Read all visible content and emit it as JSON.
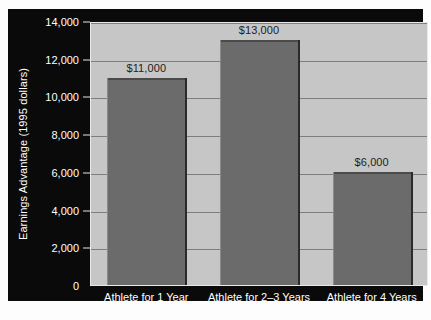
{
  "chart_data": {
    "type": "bar",
    "title": "",
    "xlabel": "",
    "ylabel": "Earnings Advantage (1995 dollars)",
    "categories": [
      "Athlete for 1 Year",
      "Athlete for 2–3 Years",
      "Athlete for 4 Years"
    ],
    "values": [
      11000,
      13000,
      6000
    ],
    "value_labels": [
      "$11,000",
      "$13,000",
      "$6,000"
    ],
    "ylim": [
      0,
      14000
    ],
    "yticks": [
      0,
      2000,
      4000,
      6000,
      8000,
      10000,
      12000,
      14000
    ],
    "ytick_labels": [
      "0",
      "2,000",
      "4,000",
      "6,000",
      "8,000",
      "10,000",
      "12,000",
      "14,000"
    ],
    "grid": true,
    "legend": false,
    "colors": {
      "bar": "#6b6b6b",
      "plot_background": "#c6c6c6",
      "panel_background": "#0a0a0a",
      "gridline": "#7e7e7e",
      "axis_text": "#ffffff",
      "value_text": "#1d1d1d"
    }
  }
}
